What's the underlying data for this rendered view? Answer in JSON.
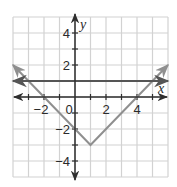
{
  "chart_data": {
    "type": "line",
    "title": "",
    "xlabel": "x",
    "ylabel": "y",
    "xlim": [
      -4,
      6
    ],
    "ylim": [
      -5,
      5
    ],
    "grid": true,
    "grid_step": 1,
    "x_tick_labels": [
      {
        "value": -2,
        "label": "−2"
      },
      {
        "value": 0,
        "label": "0"
      },
      {
        "value": 2,
        "label": "2"
      },
      {
        "value": 4,
        "label": "4"
      }
    ],
    "y_tick_labels": [
      {
        "value": 4,
        "label": "4"
      },
      {
        "value": 2,
        "label": "2"
      },
      {
        "value": -2,
        "label": "−2"
      },
      {
        "value": -4,
        "label": "−4"
      }
    ],
    "series": [
      {
        "name": "y = |x − 1| − 3",
        "color": "#8f8f8f",
        "points": [
          [
            -4,
            2
          ],
          [
            1,
            -3
          ],
          [
            6,
            2
          ]
        ],
        "arrows": "both"
      },
      {
        "name": "y = 1",
        "color": "#555555",
        "points": [
          [
            -4,
            1
          ],
          [
            6,
            1
          ]
        ],
        "arrows": "both"
      }
    ],
    "colors": {
      "grid": "#d2d2d2",
      "axes": "#2e2e2e"
    }
  }
}
